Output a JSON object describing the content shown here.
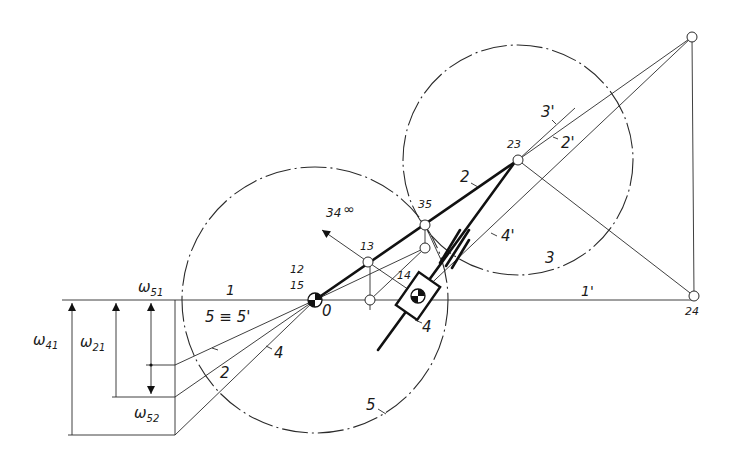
{
  "diagram": {
    "type": "kinematic-velocity-diagram",
    "colors": {
      "line": "#2a2a2a",
      "thick": "#111111",
      "background": "#ffffff"
    },
    "omega_labels": {
      "w51": {
        "base": "ω",
        "sub": "51"
      },
      "w21": {
        "base": "ω",
        "sub": "21"
      },
      "w41": {
        "base": "ω",
        "sub": "41"
      },
      "w52": {
        "base": "ω",
        "sub": "52"
      }
    },
    "poles": {
      "p12": "12",
      "p15": "15",
      "p0": "0",
      "p13": "13",
      "p14": "14",
      "p35": "35",
      "p23": "23",
      "p24": "24",
      "p34": "34",
      "p34_inf": "∞"
    },
    "link_labels": {
      "l1": "1",
      "l1p": "1'",
      "l2": "2",
      "l2p": "2'",
      "l2_left": "2",
      "l3": "3",
      "l3p": "3'",
      "l4_slider": "4",
      "l4_left": "4",
      "l4p": "4'",
      "l5": "5",
      "l5_eq": "5 ≡ 5'"
    }
  }
}
